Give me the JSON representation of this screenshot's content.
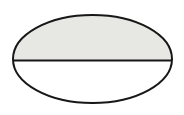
{
  "figure": {
    "title": "Ellipse divided by a horizontal chord",
    "canvas": {
      "width": 184,
      "height": 115,
      "background_color": "#ffffff"
    },
    "ellipse": {
      "name": "ellipse-outline",
      "center_x": 92.5,
      "center_y": 59.0,
      "radius_x": 79.5,
      "radius_y": 44.0,
      "stroke_color": "#171717",
      "stroke_width": 2.0,
      "fill_color": "#ffffff"
    },
    "upper_region": {
      "name": "upper-shaded-half",
      "label": "shaded upper segment",
      "fill_color": "#e7e7e4",
      "top_y": 15.0,
      "bottom_y": 60.5
    },
    "lower_region": {
      "name": "lower-unshaded-half",
      "label": "unshaded lower segment",
      "fill_color": "#ffffff",
      "top_y": 60.5,
      "bottom_y": 103.0
    },
    "chord": {
      "name": "horizontal-chord-line",
      "label": "horizontal dividing chord",
      "x1": 13.2,
      "y1": 60.5,
      "x2": 171.8,
      "y2": 60.5,
      "stroke_color": "#171717",
      "stroke_width": 2.0
    }
  }
}
